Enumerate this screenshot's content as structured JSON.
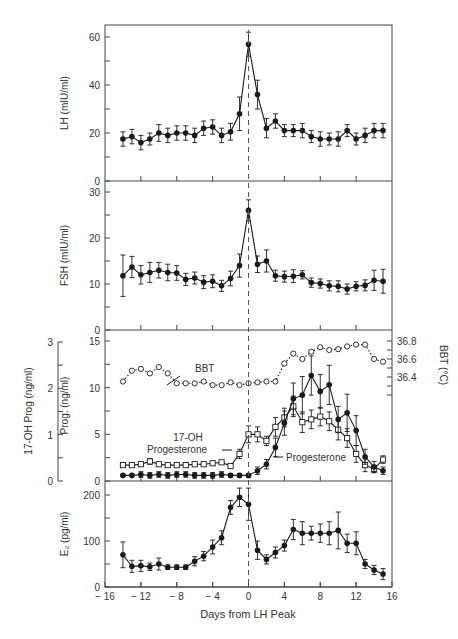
{
  "figure": {
    "xlabel": "Days from LH Peak",
    "x_ticks": [
      -16,
      -12,
      -8,
      -4,
      0,
      4,
      8,
      12,
      16
    ],
    "x_tick_labels": [
      "− 16",
      "− 12",
      "− 8",
      "− 4",
      "0",
      "4",
      "8",
      "12",
      "16"
    ],
    "ink_color": "#1a1a1a",
    "axis_color": "#444444",
    "dashed_line_x": 0
  },
  "chart_data": [
    {
      "type": "line",
      "title": "",
      "panel": "LH",
      "ylabel": "LH (mIU/ml)",
      "xlabel": "Days from LH Peak",
      "xlim": [
        -16,
        16
      ],
      "ylim": [
        0,
        65
      ],
      "y_ticks": [
        0,
        20,
        40,
        60
      ],
      "y_minor_ticks": [
        10,
        30,
        50
      ],
      "x": [
        -14,
        -13,
        -12,
        -11,
        -10,
        -9,
        -8,
        -7,
        -6,
        -5,
        -4,
        -3,
        -2,
        -1,
        0,
        1,
        2,
        3,
        4,
        5,
        6,
        7,
        8,
        9,
        10,
        11,
        12,
        13,
        14,
        15
      ],
      "series": [
        {
          "name": "LH",
          "marker": "filled-circle",
          "values": [
            17.5,
            18.5,
            16,
            17.5,
            20,
            19,
            20,
            20,
            19,
            22,
            22.5,
            19,
            20.5,
            28,
            57,
            36,
            22,
            25,
            21,
            21,
            21,
            18.5,
            17.5,
            17.5,
            17.5,
            21,
            17.5,
            19,
            21,
            21
          ],
          "error": [
            3,
            3,
            3,
            2.5,
            3.5,
            3,
            3,
            3,
            3,
            3,
            3,
            3,
            3.5,
            7,
            5,
            6,
            4,
            3,
            2.5,
            2.5,
            3,
            2.5,
            3,
            2.5,
            3,
            2.5,
            2.5,
            3,
            3,
            3
          ]
        }
      ]
    },
    {
      "type": "line",
      "title": "",
      "panel": "FSH",
      "ylabel": "FSH (mIU/ml)",
      "xlabel": "Days from LH Peak",
      "xlim": [
        -16,
        16
      ],
      "ylim": [
        0,
        32
      ],
      "y_ticks": [
        0,
        10,
        20,
        30
      ],
      "y_minor_ticks": [
        5,
        15,
        25
      ],
      "x": [
        -14,
        -13,
        -12,
        -11,
        -10,
        -9,
        -8,
        -7,
        -6,
        -5,
        -4,
        -3,
        -2,
        -1,
        0,
        1,
        2,
        3,
        4,
        5,
        6,
        7,
        8,
        9,
        10,
        11,
        12,
        13,
        14,
        15
      ],
      "series": [
        {
          "name": "FSH",
          "marker": "filled-circle",
          "values": [
            11.8,
            13.7,
            12,
            12.5,
            13,
            12.5,
            12.4,
            11,
            11.3,
            10.4,
            10.6,
            9.6,
            11.2,
            14,
            26,
            14.3,
            15,
            11.8,
            11.6,
            11.7,
            12,
            10.3,
            10.1,
            9.6,
            9.5,
            8.9,
            9.5,
            9.7,
            10.8,
            10.6
          ],
          "error": [
            4.5,
            2.3,
            2,
            2.2,
            1.7,
            1.8,
            1.6,
            1.3,
            1.3,
            1.4,
            1.4,
            1.2,
            1.6,
            2.5,
            2.3,
            1.8,
            2.4,
            1.2,
            1.2,
            1.4,
            0.9,
            1,
            1,
            1.1,
            1.2,
            1.1,
            1,
            1.2,
            2.2,
            2.6
          ]
        }
      ]
    },
    {
      "type": "line",
      "title": "",
      "panel": "Progesterone / 17-OH Progesterone / BBT",
      "ylabel": "Prog. (ng/ml)",
      "ylabel_secondary_left": "17-OH Prog (ng/ml)",
      "ylabel_right": "BBT (°C)",
      "xlabel": "Days from LH Peak",
      "xlim": [
        -16,
        16
      ],
      "ylim": [
        0,
        15.5
      ],
      "ylim_secondary_left": [
        0,
        3.1
      ],
      "ylim_right": [
        36.2,
        36.8
      ],
      "y_ticks": [
        0,
        5,
        10,
        15
      ],
      "y_minor_ticks": [
        2.5,
        7.5,
        12.5
      ],
      "y_ticks_secondary_left": [
        0,
        1,
        2,
        3
      ],
      "y_ticks_right": [
        36.4,
        36.6,
        36.8
      ],
      "x": [
        -14,
        -13,
        -12,
        -11,
        -10,
        -9,
        -8,
        -7,
        -6,
        -5,
        -4,
        -3,
        -2,
        -1,
        0,
        1,
        2,
        3,
        4,
        5,
        6,
        7,
        8,
        9,
        10,
        11,
        12,
        13,
        14,
        15
      ],
      "annotations": [
        "BBT",
        "17-OH Progesterone",
        "Progesterone"
      ],
      "series": [
        {
          "name": "Progesterone",
          "axis": "left",
          "marker": "filled-circle",
          "values": [
            0.6,
            0.6,
            0.7,
            0.6,
            0.7,
            0.6,
            0.7,
            0.7,
            0.6,
            0.6,
            0.6,
            0.7,
            0.6,
            0.6,
            0.6,
            1.1,
            1.8,
            3.6,
            6.2,
            8.8,
            9.2,
            11.3,
            9.6,
            10.3,
            6.6,
            7.3,
            5.4,
            2.6,
            1.5,
            1.1
          ],
          "error": [
            0.1,
            0.1,
            0.3,
            0.3,
            0.3,
            0.3,
            0.3,
            0.3,
            0.3,
            0.3,
            0.3,
            0.3,
            0.2,
            0.2,
            0.2,
            0.4,
            0.5,
            1,
            1.3,
            1.7,
            2,
            2.1,
            1.8,
            2.1,
            1.4,
            2,
            1.6,
            0.8,
            0.6,
            0.4
          ]
        },
        {
          "name": "17-OH Progesterone",
          "axis": "left",
          "marker": "open-square",
          "values": [
            1.7,
            1.7,
            1.8,
            2.1,
            1.8,
            1.7,
            1.7,
            1.7,
            1.8,
            1.8,
            1.9,
            2,
            2,
            1.8,
            1.6,
            2.3,
            4.9,
            5,
            4.3,
            5.4,
            6.2,
            8,
            6.5,
            6.6,
            6.9,
            6.3,
            5.6,
            4.5,
            2.4,
            1.5,
            1.9,
            2.3
          ],
          "values_note": "values aligned to x; see values_aligned",
          "values_aligned": [
            1.7,
            1.7,
            1.8,
            2.1,
            1.8,
            1.7,
            1.7,
            1.7,
            1.8,
            1.8,
            1.9,
            2,
            1.6,
            2.9,
            5,
            5,
            4.3,
            5.8,
            6.8,
            8,
            6.3,
            6.6,
            6.9,
            6.4,
            5.5,
            4.6,
            2.9,
            1.7,
            1.3,
            2.3
          ],
          "error": [
            0.1,
            0.1,
            0.1,
            0.3,
            0.1,
            0.1,
            0.1,
            0.1,
            0.1,
            0.1,
            0.1,
            0.1,
            0.1,
            0.5,
            0.9,
            0.8,
            0.5,
            1,
            1,
            1.1,
            1.1,
            1,
            1,
            1,
            1.1,
            1,
            0.9,
            0.7,
            0.4,
            0.4
          ]
        },
        {
          "name": "BBT",
          "axis": "right",
          "marker": "open-circle",
          "line_style": "dotted",
          "values": [
            36.35,
            36.47,
            36.49,
            36.44,
            36.51,
            36.44,
            36.33,
            36.33,
            36.33,
            36.35,
            36.31,
            36.31,
            36.34,
            36.31,
            36.33,
            36.34,
            36.35,
            36.35,
            36.55,
            36.66,
            36.6,
            36.68,
            36.73,
            36.7,
            36.71,
            36.74,
            36.76,
            36.76,
            36.6,
            36.61,
            36.57
          ],
          "values_aligned": [
            36.35,
            36.47,
            36.49,
            36.44,
            36.51,
            36.44,
            36.33,
            36.33,
            36.33,
            36.35,
            36.31,
            36.31,
            36.34,
            36.31,
            36.33,
            36.34,
            36.35,
            36.35,
            36.55,
            36.66,
            36.6,
            36.68,
            36.73,
            36.7,
            36.71,
            36.74,
            36.76,
            36.76,
            36.6,
            36.57
          ]
        }
      ]
    },
    {
      "type": "line",
      "title": "",
      "panel": "E2",
      "ylabel": "E₂ (pg/ml)",
      "xlabel": "Days from LH Peak",
      "xlim": [
        -16,
        16
      ],
      "ylim": [
        0,
        215
      ],
      "y_ticks": [
        0,
        100,
        200
      ],
      "y_minor_ticks": [
        50,
        150
      ],
      "x": [
        -14,
        -13,
        -12,
        -11,
        -10,
        -9,
        -8,
        -7,
        -6,
        -5,
        -4,
        -3,
        -2,
        -1,
        0,
        1,
        2,
        3,
        4,
        5,
        6,
        7,
        8,
        9,
        10,
        11,
        12,
        13,
        14,
        15
      ],
      "series": [
        {
          "name": "E2",
          "marker": "filled-circle",
          "values": [
            70,
            45,
            46,
            44,
            50,
            43,
            43,
            43,
            56,
            67,
            87,
            107,
            173,
            195,
            180,
            80,
            60,
            75,
            90,
            125,
            117,
            117,
            117,
            117,
            123,
            95,
            95,
            50,
            37,
            28
          ],
          "error": [
            28,
            13,
            12,
            8,
            13,
            5,
            5,
            5,
            10,
            10,
            15,
            15,
            15,
            20,
            35,
            20,
            10,
            12,
            12,
            22,
            25,
            15,
            20,
            25,
            40,
            20,
            25,
            10,
            10,
            12
          ]
        }
      ]
    }
  ]
}
